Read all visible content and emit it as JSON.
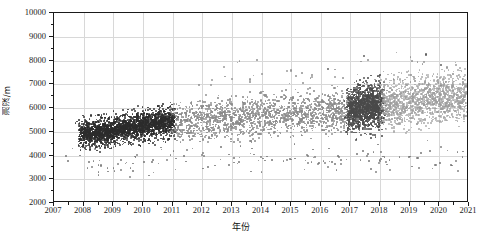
{
  "chart_data": {
    "type": "scatter",
    "title": "",
    "xlabel": "年份",
    "ylabel": "测深/m",
    "xlim": [
      2007,
      2021
    ],
    "ylim": [
      2000,
      10000
    ],
    "grid": true,
    "legend": "none",
    "x_ticks": [
      "2007",
      "2008",
      "2009",
      "2010",
      "2011",
      "2012",
      "2013",
      "2014",
      "2015",
      "2016",
      "2017",
      "2018",
      "2019",
      "2020",
      "2021"
    ],
    "y_ticks": [
      "2000",
      "3000",
      "4000",
      "5000",
      "6000",
      "7000",
      "8000",
      "9000",
      "10000"
    ],
    "x_tick_values": [
      2007,
      2008,
      2009,
      2010,
      2011,
      2012,
      2013,
      2014,
      2015,
      2016,
      2017,
      2018,
      2019,
      2020,
      2021
    ],
    "y_tick_values": [
      2000,
      3000,
      4000,
      5000,
      6000,
      7000,
      8000,
      9000,
      10000
    ],
    "point_size_px": 1.6,
    "series": [
      {
        "name": "2008-2011 早期测深",
        "color": "#2b2b2b",
        "x_range": [
          2007.9,
          2011.05
        ],
        "y_center_start": 4850,
        "y_center_end": 5450,
        "y_spread": 330,
        "n": 1500,
        "density": "very-high"
      },
      {
        "name": "2011-2016 中期测深",
        "color": "#8a8a8a",
        "x_range": [
          2011.0,
          2016.95
        ],
        "y_center_start": 5420,
        "y_center_end": 5900,
        "y_spread": 420,
        "n": 1500,
        "density": "high"
      },
      {
        "name": "2017-2018 加密测深",
        "color": "#4a4a4a",
        "x_range": [
          2016.95,
          2018.05
        ],
        "y_center_start": 5950,
        "y_center_end": 6100,
        "y_spread": 520,
        "n": 900,
        "density": "very-high"
      },
      {
        "name": "2018-2021 近期测深",
        "color": "#9c9c9c",
        "x_range": [
          2018.0,
          2021.0
        ],
        "y_center_start": 6150,
        "y_center_end": 6500,
        "y_spread": 500,
        "n": 1400,
        "density": "medium"
      },
      {
        "name": "低值离群点",
        "color": "#6e6e6e",
        "x_range": [
          2007.4,
          2021.0
        ],
        "y_center_start": 3800,
        "y_center_end": 3850,
        "y_spread": 330,
        "n": 150,
        "density": "sparse"
      },
      {
        "name": "高值离群点",
        "color": "#8a8a8a",
        "x_range": [
          2011.5,
          2020.5
        ],
        "y_center_start": 7200,
        "y_center_end": 7600,
        "y_spread": 420,
        "n": 60,
        "density": "sparse"
      }
    ],
    "notable_outliers": [
      {
        "x": 2017.45,
        "y": 8200
      },
      {
        "x": 2019.55,
        "y": 8250
      },
      {
        "x": 2016.25,
        "y": 7650
      },
      {
        "x": 2020.05,
        "y": 7800
      }
    ]
  },
  "axes": {
    "frame_color": "#1a1a1a",
    "grid_color": "#d8d8d8",
    "background": "#ffffff"
  }
}
